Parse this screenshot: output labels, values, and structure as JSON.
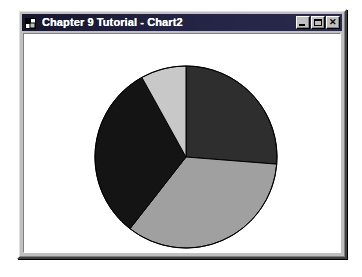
{
  "window": {
    "title": "Chapter 9 Tutorial - Chart2",
    "icon_name": "vb-form-icon",
    "buttons": {
      "minimize": {
        "label": "_",
        "name": "minimize-button"
      },
      "maximize": {
        "label": "□",
        "name": "maximize-button"
      },
      "close": {
        "label": "✕",
        "name": "close-button"
      }
    },
    "colors": {
      "titlebar": "#1d1d3a",
      "titlebar_text": "#ffffff",
      "face": "#c0c0c0",
      "client": "#ffffff"
    }
  },
  "chart_data": {
    "type": "pie",
    "title": "",
    "subtitle": "",
    "xlabel": "",
    "ylabel": "",
    "grid": false,
    "legend": "none",
    "start_angle_deg": 0,
    "direction": "clockwise",
    "center": {
      "cx": 162,
      "cy": 123
    },
    "radius": 91,
    "outline_color": "#000000",
    "categories": [
      "Slice 1",
      "Slice 2",
      "Slice 3",
      "Slice 4"
    ],
    "values": [
      26.2,
      34.3,
      31.4,
      8.1
    ],
    "angles_deg": [
      94.5,
      123.5,
      113.0,
      29.0
    ],
    "colors": [
      "#2e2e2e",
      "#a0a0a0",
      "#141414",
      "#c8c8c8"
    ],
    "slices": [
      {
        "label": "Slice 1",
        "value": 26.2,
        "start_deg": 0.0,
        "end_deg": 94.5,
        "color": "#2e2e2e"
      },
      {
        "label": "Slice 2",
        "value": 34.3,
        "start_deg": 94.5,
        "end_deg": 218.0,
        "color": "#a0a0a0"
      },
      {
        "label": "Slice 3",
        "value": 31.4,
        "start_deg": 218.0,
        "end_deg": 331.0,
        "color": "#141414"
      },
      {
        "label": "Slice 4",
        "value": 8.1,
        "start_deg": 331.0,
        "end_deg": 360.0,
        "color": "#c8c8c8"
      }
    ]
  }
}
